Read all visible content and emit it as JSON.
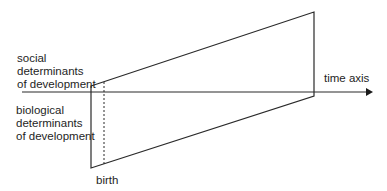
{
  "diagram": {
    "labels": {
      "social": [
        "social",
        "determinants",
        "of development"
      ],
      "biological": [
        "biological",
        "determinants",
        "of development"
      ],
      "time_axis": "time axis",
      "birth": "birth"
    },
    "colors": {
      "line": "#2a2a2a",
      "text": "#1e1e1e",
      "background": "#ffffff"
    }
  }
}
